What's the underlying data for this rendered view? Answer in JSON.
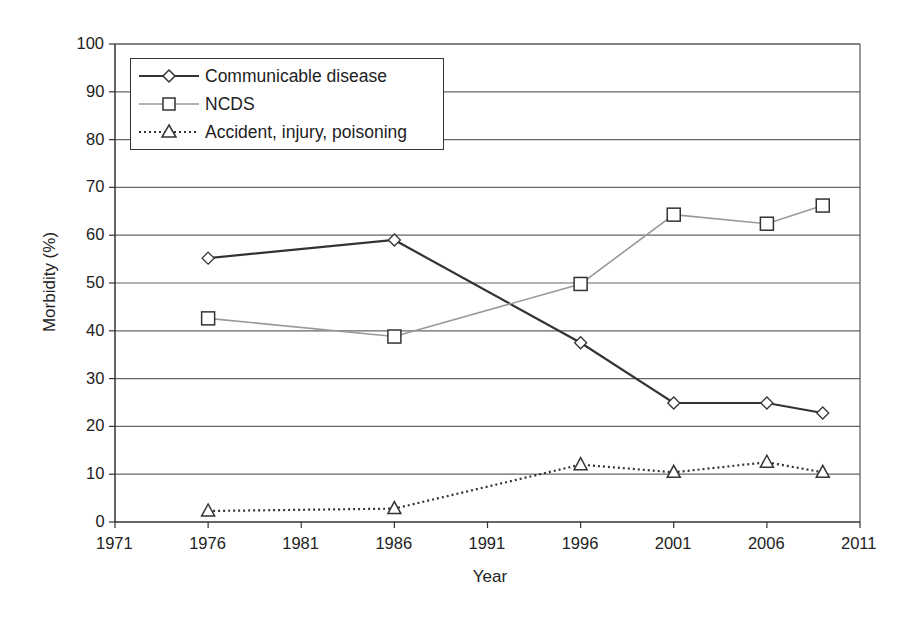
{
  "chart_data": {
    "type": "line",
    "title": "",
    "xlabel": "Year",
    "ylabel": "Morbidity (%)",
    "xlim": [
      1971,
      2011
    ],
    "ylim": [
      0,
      100
    ],
    "x_ticks": [
      1971,
      1976,
      1981,
      1986,
      1991,
      1996,
      2001,
      2006,
      2011
    ],
    "y_ticks": [
      0,
      10,
      20,
      30,
      40,
      50,
      60,
      70,
      80,
      90,
      100
    ],
    "grid": "horizontal",
    "legend_position": "upper left",
    "x": [
      1976,
      1986,
      1996,
      2001,
      2006,
      2009
    ],
    "series": [
      {
        "name": "Communicable disease",
        "marker": "diamond",
        "line": "solid",
        "color": "#333333",
        "values": [
          55.2,
          59.0,
          37.5,
          24.9,
          24.9,
          22.8
        ]
      },
      {
        "name": "NCDS",
        "marker": "square",
        "line": "solid",
        "color": "#999999",
        "values": [
          42.6,
          38.8,
          49.8,
          64.3,
          62.4,
          66.2
        ]
      },
      {
        "name": "Accident, injury, poisoning",
        "marker": "triangle",
        "line": "dotted",
        "color": "#333333",
        "values": [
          2.3,
          2.8,
          12.0,
          10.4,
          12.5,
          10.4
        ]
      }
    ]
  },
  "labels": {
    "xlabel": "Year",
    "ylabel": "Morbidity (%)",
    "legend": [
      "Communicable disease",
      "NCDS",
      "Accident, injury, poisoning"
    ],
    "x_ticks": [
      "1971",
      "1976",
      "1981",
      "1986",
      "1991",
      "1996",
      "2001",
      "2006",
      "2011"
    ],
    "y_ticks": [
      "0",
      "10",
      "20",
      "30",
      "40",
      "50",
      "60",
      "70",
      "80",
      "90",
      "100"
    ]
  }
}
